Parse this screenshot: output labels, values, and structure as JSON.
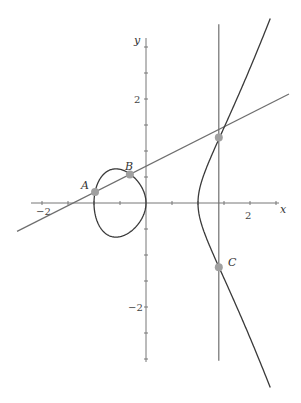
{
  "figure": {
    "equation": "y^2 = x^3 - x",
    "axes": {
      "x_label": "x",
      "y_label": "y",
      "x_tick_labels": [
        {
          "value": -2,
          "text": "−2"
        },
        {
          "value": 2,
          "text": "2"
        }
      ],
      "y_tick_labels": [
        {
          "value": 2,
          "text": "2"
        },
        {
          "value": -2,
          "text": "−2"
        }
      ],
      "tick_step": 0.5,
      "x_range": [
        -2.2,
        2.7
      ],
      "y_range": [
        -3.0,
        3.1
      ]
    },
    "points": [
      {
        "name": "A",
        "label": "A",
        "x": -0.98,
        "y": 0.2
      },
      {
        "name": "B",
        "label": "B",
        "x": -0.31,
        "y": 0.52
      },
      {
        "name": "P",
        "label": "",
        "x": 1.4,
        "y": 1.19
      },
      {
        "name": "C",
        "label": "C",
        "x": 1.4,
        "y": -1.17
      }
    ],
    "secant_line": {
      "through": [
        "A",
        "B"
      ],
      "x_from": -2.48,
      "x_to": 2.75
    },
    "vertical_line": {
      "x": 1.4,
      "y_from": -2.87,
      "y_to": 3.25
    },
    "colors": {
      "curve": "#3a3a3a",
      "lines": "#6e6e6e",
      "axes": "#777777",
      "points": "#a0a0a0"
    }
  }
}
